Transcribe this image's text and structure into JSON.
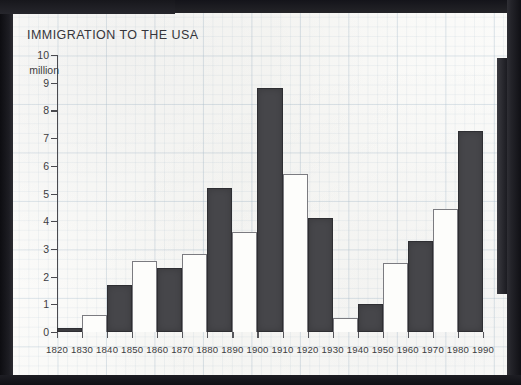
{
  "document": {
    "media": "scanned-graph-paper-chart"
  },
  "chart_data": {
    "type": "bar",
    "title": "IMMIGRATION TO THE USA",
    "xlabel": "",
    "ylabel": "",
    "y_unit_label": "million",
    "ylim": [
      0,
      10
    ],
    "y_ticks": [
      0,
      1,
      2,
      3,
      4,
      5,
      6,
      7,
      8,
      9,
      10
    ],
    "x_tick_labels": [
      "1820",
      "1830",
      "1840",
      "1850",
      "1860",
      "1870",
      "1880",
      "1890",
      "1900",
      "1910",
      "1920",
      "1930",
      "1940",
      "1950",
      "1960",
      "1970",
      "1980",
      "1990"
    ],
    "grid": true,
    "legend": "none",
    "bar_colors": {
      "dark": "#46464a",
      "light": "#fdfdfb",
      "outline": "#2e2e32"
    },
    "categories": [
      "1820-1830",
      "1830-1840",
      "1840-1850",
      "1850-1860",
      "1860-1870",
      "1870-1880",
      "1880-1890",
      "1890-1900",
      "1900-1910",
      "1910-1920",
      "1920-1930",
      "1930-1940",
      "1940-1950",
      "1950-1960",
      "1960-1970",
      "1970-1980",
      "1980-1990"
    ],
    "values": [
      0.15,
      0.6,
      1.7,
      2.55,
      2.3,
      2.8,
      5.2,
      3.6,
      8.8,
      5.7,
      4.1,
      0.5,
      1.0,
      2.5,
      3.3,
      4.45,
      7.25
    ],
    "bar_styles": [
      "dark",
      "light",
      "dark",
      "light",
      "dark",
      "light",
      "dark",
      "light",
      "dark",
      "light",
      "dark",
      "light",
      "dark",
      "light",
      "dark",
      "light",
      "dark"
    ]
  }
}
